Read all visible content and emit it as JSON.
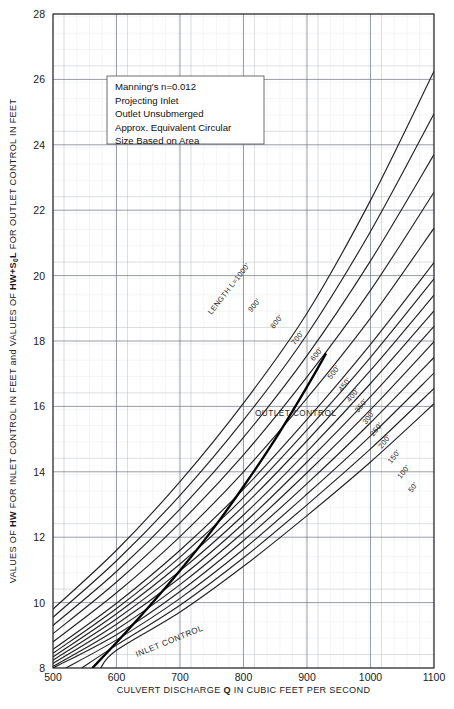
{
  "chart_data": {
    "type": "line",
    "title": "",
    "xlabel_parts": {
      "pre": "CULVERT DISCHARGE ",
      "bold": "Q",
      "post": " IN CUBIC FEET PER SECOND"
    },
    "ylabel_parts": {
      "p1": "VALUES OF ",
      "b1": "HW",
      "p2": " FOR INLET CONTROL IN FEET and VALUES OF ",
      "b2": "HW",
      "b2b": "+S",
      "b2sub": "0",
      "b2c": "L",
      "p3": " FOR OUTLET CONTROL IN FEET"
    },
    "xlim": [
      500,
      1100
    ],
    "ylim": [
      8,
      28
    ],
    "xticks": [
      500,
      600,
      700,
      800,
      900,
      1000,
      1100
    ],
    "yticks": [
      8,
      10,
      12,
      14,
      16,
      18,
      20,
      22,
      24,
      26,
      28
    ],
    "grid": "major and minor rectangular grid",
    "grid_minor_x_step": 20,
    "grid_minor_y_step": 0.5,
    "legend_position": "none",
    "annotations": [
      {
        "name": "inlet-control-label",
        "text": "INLET CONTROL",
        "x": 660,
        "y": 9.0,
        "rotation": -22
      },
      {
        "name": "outlet-control-label",
        "text": "OUTLET CONTROL",
        "x": 790,
        "y": 16.5,
        "rotation": 0
      }
    ],
    "note_box": {
      "lines": [
        "Manning's n=0.012",
        "Projecting Inlet",
        "Outlet Unsubmerged",
        "Approx. Equivalent Circular",
        "Size Based on Area"
      ]
    },
    "series": [
      {
        "name": "LENGTH L=1000'",
        "label": "LENGTH L=1000'",
        "label_x": 780,
        "label_y": 19.55,
        "points": [
          [
            500,
            9.8
          ],
          [
            600,
            11.6
          ],
          [
            700,
            13.7
          ],
          [
            800,
            16.1
          ],
          [
            900,
            18.85
          ],
          [
            1000,
            22.3
          ],
          [
            1100,
            26.25
          ]
        ]
      },
      {
        "name": "900'",
        "label": "900'",
        "label_x": 820,
        "label_y": 19.05,
        "points": [
          [
            500,
            9.55
          ],
          [
            600,
            11.28
          ],
          [
            700,
            13.28
          ],
          [
            800,
            15.58
          ],
          [
            900,
            18.2
          ],
          [
            1000,
            21.35
          ],
          [
            1100,
            24.95
          ]
        ]
      },
      {
        "name": "800'",
        "label": "800'",
        "label_x": 855,
        "label_y": 18.55,
        "points": [
          [
            500,
            9.3
          ],
          [
            600,
            10.95
          ],
          [
            700,
            12.86
          ],
          [
            800,
            15.05
          ],
          [
            900,
            17.55
          ],
          [
            1000,
            20.45
          ],
          [
            1100,
            23.7
          ]
        ]
      },
      {
        "name": "700'",
        "label": "700'",
        "label_x": 888,
        "label_y": 18.05,
        "points": [
          [
            500,
            9.05
          ],
          [
            600,
            10.63
          ],
          [
            700,
            12.44
          ],
          [
            800,
            14.52
          ],
          [
            900,
            16.9
          ],
          [
            1000,
            19.55
          ],
          [
            1100,
            22.55
          ]
        ]
      },
      {
        "name": "600'",
        "label": "600'",
        "label_x": 918,
        "label_y": 17.55,
        "points": [
          [
            500,
            8.8
          ],
          [
            600,
            10.3
          ],
          [
            700,
            12.02
          ],
          [
            800,
            14.0
          ],
          [
            900,
            16.25
          ],
          [
            1000,
            18.7
          ],
          [
            1100,
            21.45
          ]
        ]
      },
      {
        "name": "500'",
        "label": "500'",
        "label_x": 945,
        "label_y": 17.0,
        "points": [
          [
            500,
            8.57
          ],
          [
            600,
            9.98
          ],
          [
            700,
            11.6
          ],
          [
            800,
            13.47
          ],
          [
            900,
            15.6
          ],
          [
            1000,
            17.9
          ],
          [
            1100,
            20.4
          ]
        ]
      },
      {
        "name": "450'",
        "label": "450'",
        "label_x": 962,
        "label_y": 16.62,
        "points": [
          [
            500,
            8.45
          ],
          [
            600,
            9.82
          ],
          [
            700,
            11.39
          ],
          [
            800,
            13.21
          ],
          [
            900,
            15.28
          ],
          [
            1000,
            17.5
          ],
          [
            1100,
            19.9
          ]
        ]
      },
      {
        "name": "400'",
        "label": "400'",
        "label_x": 975,
        "label_y": 16.3,
        "points": [
          [
            500,
            8.34
          ],
          [
            600,
            9.66
          ],
          [
            700,
            11.18
          ],
          [
            800,
            12.95
          ],
          [
            900,
            14.95
          ],
          [
            1000,
            17.1
          ],
          [
            1100,
            19.4
          ]
        ]
      },
      {
        "name": "350'",
        "label": "350'",
        "label_x": 988,
        "label_y": 15.98,
        "points": [
          [
            500,
            8.24
          ],
          [
            600,
            9.5
          ],
          [
            700,
            10.97
          ],
          [
            800,
            12.68
          ],
          [
            900,
            14.62
          ],
          [
            1000,
            16.7
          ],
          [
            1100,
            18.92
          ]
        ]
      },
      {
        "name": "300'",
        "label": "300'",
        "label_x": 1000,
        "label_y": 15.62,
        "points": [
          [
            500,
            8.14
          ],
          [
            600,
            9.34
          ],
          [
            700,
            10.76
          ],
          [
            800,
            12.42
          ],
          [
            900,
            14.3
          ],
          [
            1000,
            16.3
          ],
          [
            1100,
            18.45
          ]
        ]
      },
      {
        "name": "250'",
        "label": "250'",
        "label_x": 1012,
        "label_y": 15.25,
        "points": [
          [
            500,
            8.05
          ],
          [
            600,
            9.18
          ],
          [
            700,
            10.55
          ],
          [
            800,
            12.16
          ],
          [
            900,
            13.97
          ],
          [
            1000,
            15.9
          ],
          [
            1100,
            17.98
          ]
        ]
      },
      {
        "name": "200'",
        "label": "200'",
        "label_x": 1025,
        "label_y": 14.88,
        "points": [
          [
            500,
            8.0
          ],
          [
            600,
            9.02
          ],
          [
            700,
            10.34
          ],
          [
            800,
            11.9
          ],
          [
            900,
            13.64
          ],
          [
            1000,
            15.5
          ],
          [
            1100,
            17.5
          ]
        ]
      },
      {
        "name": "150'",
        "label": "150'",
        "label_x": 1040,
        "label_y": 14.42,
        "points": [
          [
            520,
            8.0
          ],
          [
            600,
            8.86
          ],
          [
            700,
            10.13
          ],
          [
            800,
            11.63
          ],
          [
            900,
            13.32
          ],
          [
            1000,
            15.1
          ],
          [
            1100,
            17.02
          ]
        ]
      },
      {
        "name": "100'",
        "label": "100'",
        "label_x": 1055,
        "label_y": 13.95,
        "points": [
          [
            545,
            8.0
          ],
          [
            600,
            8.7
          ],
          [
            700,
            9.92
          ],
          [
            800,
            11.37
          ],
          [
            900,
            12.99
          ],
          [
            1000,
            14.7
          ],
          [
            1100,
            16.55
          ]
        ]
      },
      {
        "name": "50'",
        "label": "50'",
        "label_x": 1070,
        "label_y": 13.48,
        "points": [
          [
            575,
            8.0
          ],
          [
            600,
            8.54
          ],
          [
            700,
            9.71
          ],
          [
            800,
            11.11
          ],
          [
            900,
            12.66
          ],
          [
            1000,
            14.3
          ],
          [
            1100,
            16.08
          ]
        ]
      }
    ],
    "inlet_control_curve": {
      "name": "INLET CONTROL",
      "style": "heavy solid line",
      "points": [
        [
          562,
          8.0
        ],
        [
          600,
          8.78
        ],
        [
          650,
          9.85
        ],
        [
          700,
          10.98
        ],
        [
          750,
          12.2
        ],
        [
          800,
          13.55
        ],
        [
          850,
          15.0
        ],
        [
          900,
          16.6
        ],
        [
          930,
          17.62
        ]
      ]
    }
  }
}
